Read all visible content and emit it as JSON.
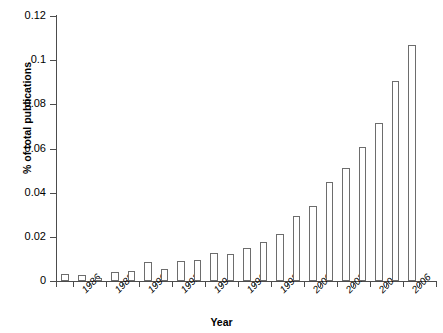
{
  "chart_data": {
    "type": "bar",
    "title": "",
    "subtitle": "",
    "xlabel": "Year",
    "ylabel": "% of total publications",
    "ylim": [
      0,
      0.12
    ],
    "ytick_values": [
      0,
      0.02,
      0.04,
      0.06,
      0.08,
      0.1,
      0.12
    ],
    "ytick_labels": [
      "0",
      "0.02",
      "0.04",
      "0.06",
      "0.08",
      "0.1",
      "0.12"
    ],
    "grid": false,
    "legend": false,
    "legend_position": "none",
    "bar_style": {
      "fill": "#ffffff",
      "edge": "#6d6d6d"
    },
    "categories": [
      "1985",
      "1986",
      "1987",
      "1988",
      "1989",
      "1990",
      "1991",
      "1992",
      "1993",
      "1994",
      "1995",
      "1996",
      "1997",
      "1998",
      "1999",
      "2000",
      "2001",
      "2002",
      "2003",
      "2004",
      "2005",
      "2006",
      "2007"
    ],
    "xtick_labels": [
      "",
      "1986",
      "",
      "1988",
      "",
      "1990",
      "",
      "1992",
      "",
      "1994",
      "",
      "1996",
      "",
      "1998",
      "",
      "2000",
      "",
      "2002",
      "",
      "2004",
      "",
      "2006",
      ""
    ],
    "visible_xtick_labels": [
      "1986",
      "1988",
      "1990",
      "1992",
      "1994",
      "1996",
      "1998",
      "2000",
      "2002",
      "2004",
      "2006"
    ],
    "values": [
      0.003,
      0.0027,
      0.0013,
      0.0042,
      0.0045,
      0.0087,
      0.0055,
      0.0092,
      0.0097,
      0.0125,
      0.0124,
      0.0148,
      0.0178,
      0.0212,
      0.0295,
      0.0341,
      0.045,
      0.0513,
      0.0607,
      0.0716,
      0.0906,
      0.107,
      0.0
    ]
  },
  "decor": {
    "watermark": ""
  }
}
